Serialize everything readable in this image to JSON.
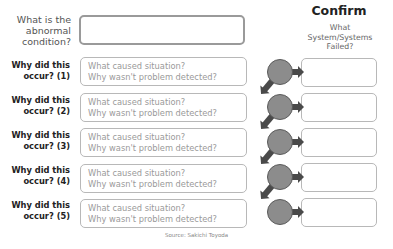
{
  "question": {
    "label": "What is the abnormal condition?",
    "lines": [
      "What is the",
      "abnormal",
      "condition?"
    ]
  },
  "confirm": {
    "title": "Confirm",
    "subtitle_lines": [
      "What",
      "System/Systems",
      "Failed?"
    ]
  },
  "whys": [
    {
      "label_line1": "Why did this",
      "label_line2": "occur? (1)",
      "prompt1": "What caused situation?",
      "prompt2": "Why wasn't problem detected?"
    },
    {
      "label_line1": "Why did this",
      "label_line2": "occur? (2)",
      "prompt1": "What caused situation?",
      "prompt2": "Why wasn't problem detected?"
    },
    {
      "label_line1": "Why did this",
      "label_line2": "occur? (3)",
      "prompt1": "What caused situation?",
      "prompt2": "Why wasn't problem detected?"
    },
    {
      "label_line1": "Why did this",
      "label_line2": "occur? (4)",
      "prompt1": "What caused situation?",
      "prompt2": "Why wasn't problem detected?"
    },
    {
      "label_line1": "Why did this",
      "label_line2": "occur? (5)",
      "prompt1": "What caused situation?",
      "prompt2": "Why wasn't problem detected?"
    }
  ],
  "source": "Source: Sakichi Toyoda",
  "colors": {
    "circle_fill": "#8c8c8c",
    "circle_stroke": "#5a5a5a",
    "arrow": "#4a4a4a",
    "box_border": "#b8b8b8",
    "main_box_border": "#9a9a9a"
  }
}
